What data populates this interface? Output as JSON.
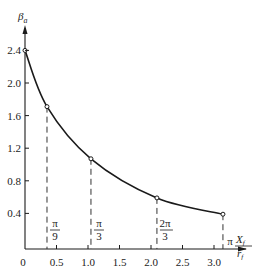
{
  "chart_data": {
    "type": "line",
    "title": "",
    "xlabel": "X_f / r_f",
    "ylabel": "β_a",
    "xlim": [
      0,
      3.4
    ],
    "ylim": [
      0,
      2.6
    ],
    "grid": false,
    "legend": null,
    "x_ticks": [
      "0",
      "0.5",
      "1.0",
      "1.5",
      "2.0",
      "2.5",
      "3.0"
    ],
    "y_ticks": [
      "0.4",
      "0.8",
      "1.2",
      "1.6",
      "2.0",
      "2.4"
    ],
    "series": [
      {
        "name": "β_a",
        "x": [
          0,
          0.349,
          1.047,
          2.094,
          3.142
        ],
        "y": [
          2.4,
          1.71,
          1.07,
          0.59,
          0.39
        ]
      }
    ],
    "annotations": [
      {
        "x": 0.349,
        "label_num": "π",
        "label_den": "9"
      },
      {
        "x": 1.047,
        "label_num": "π",
        "label_den": "3"
      },
      {
        "x": 2.094,
        "label_num": "2π",
        "label_den": "3"
      },
      {
        "x": 3.142,
        "label_num": "π",
        "label_den": ""
      }
    ]
  },
  "labels": {
    "y_axis_symbol": "β",
    "y_axis_sub": "a",
    "x_axis_num": "X",
    "x_axis_num_sub": "f",
    "x_axis_den": "r",
    "x_axis_den_sub": "f"
  },
  "colors": {
    "line": "#1a1a1a",
    "axis": "#1a1a1a",
    "dash": "#333333"
  }
}
